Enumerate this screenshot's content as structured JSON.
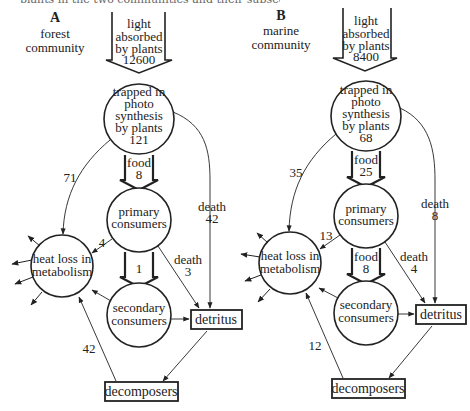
{
  "caption": "plants in the two communities and their subsequent fate (kcal m⁻² yr⁻¹)",
  "panels": [
    {
      "id": "A",
      "letter": "A",
      "title_line1": "forest",
      "title_line2": "community",
      "light": {
        "line1": "light",
        "line2": "absorbed",
        "line3": "by plants",
        "value": "12600"
      },
      "producers": {
        "line1": "trapped in",
        "line2": "photo",
        "line3": "synthesis",
        "line4": "by plants",
        "value": "121"
      },
      "food_to_primary": {
        "label": "food",
        "value": "8"
      },
      "primary": {
        "line1": "primary",
        "line2": "consumers"
      },
      "food_to_secondary": {
        "label": "",
        "value": "1"
      },
      "secondary": {
        "line1": "secondary",
        "line2": "consumers"
      },
      "heat": {
        "line1": "heat loss in",
        "line2": "metabolism"
      },
      "detritus": {
        "label": "detritus"
      },
      "decomposers": {
        "label": "decomposers"
      },
      "producer_respiration": "71",
      "primary_respiration": "4",
      "producer_death": {
        "label": "death",
        "value": "42"
      },
      "primary_death": {
        "label": "death",
        "value": "3"
      },
      "decomposer_respiration": "42"
    },
    {
      "id": "B",
      "letter": "B",
      "title_line1": "marine",
      "title_line2": "community",
      "light": {
        "line1": "light",
        "line2": "absorbed",
        "line3": "by plants",
        "value": "8400"
      },
      "producers": {
        "line1": "trapped in",
        "line2": "photo",
        "line3": "synthesis",
        "line4": "by plants",
        "value": "68"
      },
      "food_to_primary": {
        "label": "food",
        "value": "25"
      },
      "primary": {
        "line1": "primary",
        "line2": "consumers"
      },
      "food_to_secondary": {
        "label": "food",
        "value": "8"
      },
      "secondary": {
        "line1": "secondary",
        "line2": "consumers"
      },
      "heat": {
        "line1": "heat loss in",
        "line2": "metabolism"
      },
      "detritus": {
        "label": "detritus"
      },
      "decomposers": {
        "label": "decomposers"
      },
      "producer_respiration": "35",
      "primary_respiration": "13",
      "producer_death": {
        "label": "death",
        "value": "8"
      },
      "primary_death": {
        "label": "death",
        "value": "4"
      },
      "decomposer_respiration": "12"
    }
  ],
  "colors": {
    "stroke": "#222222",
    "text": "#222222",
    "background": "#ffffff"
  }
}
